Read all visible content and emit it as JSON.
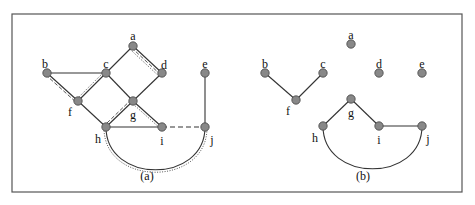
{
  "frame": {
    "x": 12,
    "y": 14,
    "w": 450,
    "h": 178,
    "stroke": "#555"
  },
  "node_color": "#888888",
  "panels": [
    {
      "caption": "(a)",
      "caption_pos": [
        147,
        176
      ],
      "nodes": [
        {
          "id": "a",
          "x": 133,
          "y": 46,
          "lx": 133,
          "ly": 36
        },
        {
          "id": "b",
          "x": 47,
          "y": 73,
          "lx": 45,
          "ly": 64
        },
        {
          "id": "c",
          "x": 106,
          "y": 73,
          "lx": 106,
          "ly": 64
        },
        {
          "id": "d",
          "x": 162,
          "y": 73,
          "lx": 164,
          "ly": 65
        },
        {
          "id": "e",
          "x": 205,
          "y": 73,
          "lx": 205,
          "ly": 64
        },
        {
          "id": "f",
          "x": 78,
          "y": 101,
          "lx": 70,
          "ly": 112
        },
        {
          "id": "g",
          "x": 133,
          "y": 101,
          "lx": 133,
          "ly": 115
        },
        {
          "id": "h",
          "x": 106,
          "y": 127,
          "lx": 98,
          "ly": 139
        },
        {
          "id": "i",
          "x": 162,
          "y": 127,
          "lx": 162,
          "ly": 141
        },
        {
          "id": "j",
          "x": 205,
          "y": 127,
          "lx": 212,
          "ly": 140
        }
      ],
      "edges": [
        {
          "from": "a",
          "to": "c",
          "style": "solid"
        },
        {
          "from": "a",
          "to": "d",
          "style": "solid",
          "extra": [
            "dashed",
            "dotted"
          ]
        },
        {
          "from": "b",
          "to": "c",
          "style": "solid"
        },
        {
          "from": "b",
          "to": "f",
          "style": "solid",
          "extra": [
            "dashed"
          ]
        },
        {
          "from": "c",
          "to": "f",
          "style": "solid",
          "extra": [
            "dotted"
          ]
        },
        {
          "from": "c",
          "to": "g",
          "style": "solid"
        },
        {
          "from": "d",
          "to": "g",
          "style": "solid"
        },
        {
          "from": "f",
          "to": "h",
          "style": "solid"
        },
        {
          "from": "g",
          "to": "h",
          "style": "solid",
          "extra": [
            "dashed"
          ]
        },
        {
          "from": "g",
          "to": "i",
          "style": "solid",
          "extra": [
            "dotted"
          ]
        },
        {
          "from": "h",
          "to": "i",
          "style": "solid"
        },
        {
          "from": "i",
          "to": "j",
          "style": "dashed"
        },
        {
          "from": "e",
          "to": "j",
          "style": "solid"
        }
      ],
      "arc": {
        "from": "h",
        "to": "j",
        "depth": 30,
        "extra": [
          "dotted"
        ]
      }
    },
    {
      "caption": "(b)",
      "caption_pos": [
        363,
        176
      ],
      "nodes": [
        {
          "id": "a",
          "x": 351,
          "y": 44,
          "lx": 351,
          "ly": 35
        },
        {
          "id": "b",
          "x": 265,
          "y": 73,
          "lx": 265,
          "ly": 64
        },
        {
          "id": "c",
          "x": 323,
          "y": 73,
          "lx": 323,
          "ly": 64
        },
        {
          "id": "d",
          "x": 379,
          "y": 73,
          "lx": 379,
          "ly": 64
        },
        {
          "id": "e",
          "x": 422,
          "y": 73,
          "lx": 422,
          "ly": 64
        },
        {
          "id": "f",
          "x": 296,
          "y": 100,
          "lx": 288,
          "ly": 111
        },
        {
          "id": "g",
          "x": 351,
          "y": 99,
          "lx": 351,
          "ly": 113
        },
        {
          "id": "h",
          "x": 323,
          "y": 126,
          "lx": 315,
          "ly": 138
        },
        {
          "id": "i",
          "x": 379,
          "y": 126,
          "lx": 379,
          "ly": 140
        },
        {
          "id": "j",
          "x": 422,
          "y": 126,
          "lx": 428,
          "ly": 139
        }
      ],
      "edges": [
        {
          "from": "b",
          "to": "f",
          "style": "solid"
        },
        {
          "from": "c",
          "to": "f",
          "style": "solid"
        },
        {
          "from": "g",
          "to": "h",
          "style": "solid"
        },
        {
          "from": "g",
          "to": "i",
          "style": "solid"
        },
        {
          "from": "i",
          "to": "j",
          "style": "solid"
        }
      ],
      "arc": {
        "from": "h",
        "to": "j",
        "depth": 30,
        "extra": []
      }
    }
  ]
}
